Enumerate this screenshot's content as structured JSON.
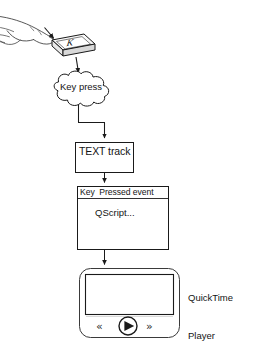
{
  "diagram": {
    "stroke_color": "#1a1a1a",
    "fill_color": "#ffffff",
    "nodes": {
      "hand": {
        "icon": "pointing-hand-icon",
        "description": "Hand with extended index finger pressing a key"
      },
      "keycap": {
        "icon": "keyboard-key-icon",
        "key_letter": "K"
      },
      "cloud": {
        "shape": "cloud",
        "label": "Key press"
      },
      "text_track": {
        "shape": "rectangle",
        "label": "TEXT track"
      },
      "event_box": {
        "shape": "rectangle-with-header",
        "header": "Key  Pressed event",
        "body": "QScript..."
      },
      "player": {
        "shape": "rounded-rectangle",
        "label": "QuickTime\nPlayer",
        "label_line1": "QuickTime",
        "label_line2": "Player",
        "controls": {
          "rewind": "«",
          "play": "play-triangle-icon",
          "forward": "»"
        }
      }
    },
    "connectors": [
      {
        "from": "keycap",
        "to": "cloud",
        "arrow": true
      },
      {
        "from": "cloud",
        "to": "text_track",
        "arrow": true,
        "style": "elbow"
      },
      {
        "from": "text_track",
        "to": "event_box",
        "arrow": true
      },
      {
        "from": "event_box",
        "to": "player",
        "arrow": true
      }
    ]
  }
}
